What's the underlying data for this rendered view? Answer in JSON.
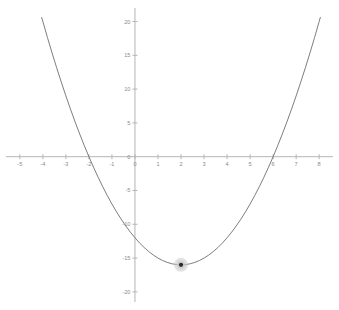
{
  "chart_data": {
    "type": "line",
    "title": "",
    "subtitle": "",
    "xlabel": "",
    "ylabel": "",
    "xlim": [
      -5.6,
      8.6
    ],
    "ylim": [
      -21.5,
      22.0
    ],
    "grid": false,
    "legend": "none",
    "series": [
      {
        "name": "y = x^2 - 4x - 12",
        "equation": "y = x^2 - 4x - 12",
        "color": "#6e6e6e",
        "x": [
          -4.05,
          -3.8,
          -3.6,
          -3.4,
          -3.2,
          -3.0,
          -2.8,
          -2.6,
          -2.4,
          -2.2,
          -2.0,
          -1.8,
          -1.6,
          -1.4,
          -1.2,
          -1.0,
          -0.8,
          -0.6,
          -0.4,
          -0.2,
          0.0,
          0.2,
          0.4,
          0.6,
          0.8,
          1.0,
          1.2,
          1.4,
          1.6,
          1.8,
          2.0,
          2.2,
          2.4,
          2.6,
          2.8,
          3.0,
          3.2,
          3.4,
          3.6,
          3.8,
          4.0,
          4.2,
          4.4,
          4.6,
          4.8,
          5.0,
          5.2,
          5.4,
          5.6,
          5.8,
          6.0,
          6.2,
          6.4,
          6.6,
          6.8,
          7.0,
          7.2,
          7.4,
          7.6,
          7.8,
          8.0,
          8.05
        ],
        "y": [
          20.6,
          17.64,
          15.36,
          13.16,
          11.04,
          9.0,
          7.04,
          5.16,
          3.36,
          1.64,
          0.0,
          -1.56,
          -3.04,
          -4.44,
          -5.76,
          -7.0,
          -8.16,
          -9.24,
          -10.24,
          -11.16,
          -12.0,
          -12.76,
          -13.44,
          -14.04,
          -14.56,
          -15.0,
          -15.36,
          -15.64,
          -15.84,
          -15.96,
          -16.0,
          -15.96,
          -15.84,
          -15.64,
          -15.36,
          -15.0,
          -14.56,
          -14.04,
          -13.44,
          -12.76,
          -12.0,
          -11.16,
          -10.24,
          -9.24,
          -8.16,
          -7.0,
          -5.76,
          -4.44,
          -3.04,
          -1.56,
          0.0,
          1.64,
          3.36,
          5.16,
          7.04,
          9.0,
          11.04,
          13.16,
          15.36,
          17.64,
          20.0,
          20.6
        ]
      }
    ],
    "points": [
      {
        "name": "vertex",
        "x": 2,
        "y": -16,
        "label": "",
        "marker": "dot-with-halo",
        "dot_color": "#2b2b2b",
        "halo_color": "#c9c9c9"
      }
    ],
    "roots": [
      -2,
      6
    ],
    "y_intercept": -12,
    "x_axis": {
      "ticks": [
        -5,
        -4,
        -3,
        -2,
        -1,
        0,
        1,
        2,
        3,
        4,
        5,
        6,
        7,
        8
      ],
      "tick_labels": [
        "-5",
        "-4",
        "-3",
        "-2",
        "-1",
        "0",
        "1",
        "2",
        "3",
        "4",
        "5",
        "6",
        "7",
        "8"
      ],
      "color": "#b5b5b5"
    },
    "y_axis": {
      "ticks": [
        -20,
        -15,
        -10,
        -5,
        0,
        5,
        10,
        15,
        20
      ],
      "tick_labels": [
        "-20",
        "-15",
        "-10",
        "-5",
        "0",
        "5",
        "10",
        "15",
        "20"
      ],
      "color": "#b5b5b5"
    }
  }
}
